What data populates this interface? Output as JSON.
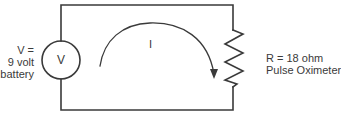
{
  "diagram": {
    "type": "circuit",
    "source": {
      "symbol": "V",
      "label_lines": [
        "V =",
        "9 volt",
        "battery"
      ]
    },
    "current": {
      "label": "I",
      "direction": "clockwise"
    },
    "load": {
      "label_lines": [
        "R = 18 ohm",
        "Pulse Oximeter"
      ]
    },
    "colors": {
      "wire": "#3a3a3a",
      "background": "#ffffff"
    }
  }
}
